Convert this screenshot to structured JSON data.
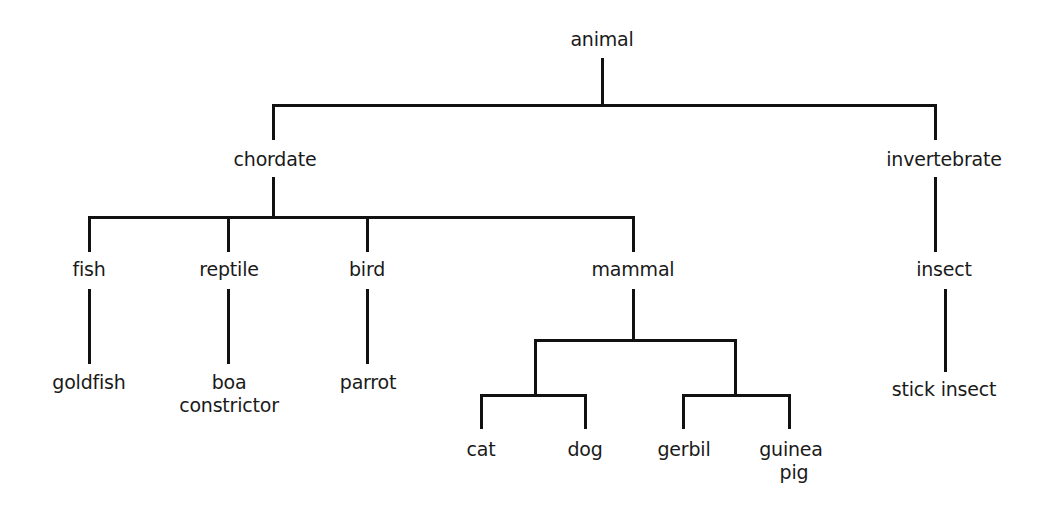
{
  "diagram": {
    "type": "taxonomy-tree",
    "line_color": "#111111",
    "root": {
      "label": "animal",
      "children": [
        {
          "label": "chordate",
          "children": [
            {
              "label": "fish",
              "children": [
                {
                  "label": "goldfish"
                }
              ]
            },
            {
              "label": "reptile",
              "children": [
                {
                  "label": "boa constrictor"
                }
              ]
            },
            {
              "label": "bird",
              "children": [
                {
                  "label": "parrot"
                }
              ]
            },
            {
              "label": "mammal",
              "children": [
                {
                  "label": "cat"
                },
                {
                  "label": "dog"
                },
                {
                  "label": "gerbil"
                },
                {
                  "label": "guinea pig"
                }
              ]
            }
          ]
        },
        {
          "label": "invertebrate",
          "children": [
            {
              "label": "insect",
              "children": [
                {
                  "label": "stick insect"
                }
              ]
            }
          ]
        }
      ]
    },
    "labels": {
      "animal": "animal",
      "chordate": "chordate",
      "invertebrate": "invertebrate",
      "fish": "fish",
      "reptile": "reptile",
      "bird": "bird",
      "mammal": "mammal",
      "insect": "insect",
      "goldfish": "goldfish",
      "boa_line1": "boa",
      "boa_line2": "constrictor",
      "parrot": "parrot",
      "cat": "cat",
      "dog": "dog",
      "gerbil": "gerbil",
      "guinea_line1": "guinea",
      "guinea_line2": "pig",
      "stick_insect": "stick insect"
    }
  }
}
